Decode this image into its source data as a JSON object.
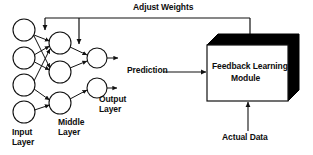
{
  "diagram": {
    "type": "block-diagram",
    "background": "#ffffff",
    "stroke_color": "#111111",
    "text_color": "#0d0d0d",
    "shadow_color": "#000000"
  },
  "labels": {
    "adjust_weights": "Adjust Weights",
    "prediction": "Prediction",
    "actual_data": "Actual Data",
    "input_layer": "Input\nLayer",
    "middle_layer": "Middle\nLayer",
    "output_layer": "Output\nLayer",
    "module_line1": "Feedback Learning",
    "module_line2": "Module"
  },
  "network": {
    "input_layer": {
      "name": "Input Layer",
      "node_count": 4,
      "radius": 11,
      "nodes": [
        {
          "id": "i1",
          "cx": 24,
          "cy": 30
        },
        {
          "id": "i2",
          "cx": 24,
          "cy": 58
        },
        {
          "id": "i3",
          "cx": 24,
          "cy": 85
        },
        {
          "id": "i4",
          "cx": 24,
          "cy": 112
        }
      ]
    },
    "middle_layer": {
      "name": "Middle Layer",
      "node_count": 3,
      "radius": 11,
      "nodes": [
        {
          "id": "m1",
          "cx": 60,
          "cy": 43
        },
        {
          "id": "m2",
          "cx": 60,
          "cy": 72
        },
        {
          "id": "m3",
          "cx": 60,
          "cy": 103
        }
      ]
    },
    "output_layer": {
      "name": "Output Layer",
      "node_count": 2,
      "radius": 10,
      "nodes": [
        {
          "id": "o1",
          "cx": 97,
          "cy": 58
        },
        {
          "id": "o2",
          "cx": 97,
          "cy": 88
        }
      ]
    },
    "connections": [
      {
        "from": "i1",
        "to": "m1"
      },
      {
        "from": "i1",
        "to": "m2"
      },
      {
        "from": "i2",
        "to": "m1"
      },
      {
        "from": "i2",
        "to": "m2"
      },
      {
        "from": "i3",
        "to": "m1"
      },
      {
        "from": "i3",
        "to": "m3"
      },
      {
        "from": "i4",
        "to": "m3"
      },
      {
        "from": "m1",
        "to": "o1"
      },
      {
        "from": "m2",
        "to": "o1"
      },
      {
        "from": "m3",
        "to": "o2"
      }
    ],
    "output_arrows": [
      {
        "from": "o1",
        "label": "prediction-out"
      },
      {
        "from": "o2",
        "label": "secondary-out"
      }
    ]
  },
  "module": {
    "name": "Feedback Learning Module",
    "box": {
      "x": 207,
      "y": 45,
      "width": 81,
      "height": 56
    },
    "depth": 11,
    "face_fill": "#ffffff",
    "shade_fill": "#000000"
  },
  "flows": [
    {
      "id": "adjust-weights",
      "label": "Adjust Weights",
      "direction": "module-to-network",
      "path": "box-top up to y=18, left to x=45, branch arrows down into middle layer",
      "branch_x": [
        45,
        79
      ],
      "rail_y": 18,
      "riser_x": 250
    },
    {
      "id": "prediction",
      "label": "Prediction",
      "direction": "network-to-module",
      "arrow": "right"
    },
    {
      "id": "actual-data",
      "label": "Actual Data",
      "direction": "into-module-bottom",
      "arrow": "up"
    }
  ]
}
